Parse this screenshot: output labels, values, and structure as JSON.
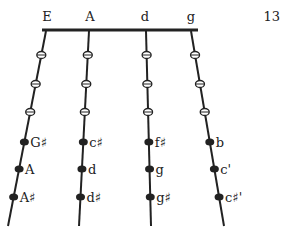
{
  "page_number": "13",
  "strings": [
    {
      "name": "E",
      "top": [
        46,
        31
      ],
      "bottom": [
        8,
        226
      ],
      "notes": [
        "G♯",
        "A",
        "A♯"
      ]
    },
    {
      "name": "A",
      "top": [
        89,
        31
      ],
      "bottom": [
        79,
        226
      ],
      "notes": [
        "c♯",
        "d",
        "d♯"
      ]
    },
    {
      "name": "d",
      "top": [
        146,
        31
      ],
      "bottom": [
        151,
        226
      ],
      "notes": [
        "f♯",
        "g",
        "g♯"
      ]
    },
    {
      "name": "g",
      "top": [
        191,
        31
      ],
      "bottom": [
        224,
        226
      ],
      "notes": [
        "b",
        "c'",
        "c♯'"
      ]
    }
  ],
  "open_marker_rows_y": [
    55,
    84,
    112
  ],
  "filled_marker_rows_y": [
    142,
    169,
    197
  ],
  "colors": {
    "ink": "#222222",
    "background": "#ffffff"
  }
}
